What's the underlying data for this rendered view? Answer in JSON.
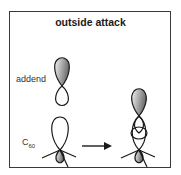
{
  "diagram": {
    "title": "outside attack",
    "labels": {
      "addend": "addend",
      "c60_base": "C",
      "c60_sub": "60"
    },
    "elements": [
      {
        "type": "orbital",
        "name": "addend-p-orbital",
        "upper_lobe": "shaded",
        "lower_lobe": "open"
      },
      {
        "type": "orbital",
        "name": "c60-p-orbital",
        "upper_lobe": "open",
        "lower_lobe": "shaded",
        "with_bonds": 3
      },
      {
        "type": "arrow",
        "direction": "right"
      },
      {
        "type": "orbital-overlap",
        "name": "product-orbital",
        "top_lobe": "shaded",
        "middle": "overlap",
        "bottom_lobe": "shaded",
        "with_bonds": 3
      }
    ],
    "colors": {
      "border": "#3a3a3a",
      "line": "#1a1a1a",
      "shade_dark": "#7a7a7a",
      "shade_light": "#f2f2f2"
    }
  }
}
